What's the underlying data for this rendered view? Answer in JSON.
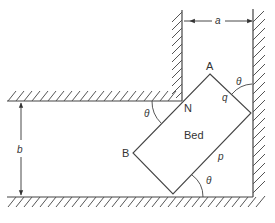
{
  "diagram": {
    "colors": {
      "line": "#444444",
      "hatch": "#555555",
      "text": "#333333",
      "background": "#ffffff"
    },
    "labels": {
      "a": "a",
      "b": "b",
      "A": "A",
      "B": "B",
      "N": "N",
      "bed": "Bed",
      "p": "p",
      "q": "q",
      "theta_top_right": "θ",
      "theta_left": "θ",
      "theta_bottom": "θ"
    },
    "geometry": {
      "inner_corner_N": [
        182,
        101
      ],
      "upper_wall_y": 101,
      "floor_y": 197,
      "inner_wall_x": 182,
      "outer_wall_x": 253,
      "bed_corners": {
        "A": [
          210,
          74
        ],
        "right": [
          251,
          113
        ],
        "bottom": [
          173,
          194
        ],
        "B": [
          133,
          153
        ]
      },
      "dimension_a_y": 21,
      "dimension_b_x": 21
    }
  }
}
